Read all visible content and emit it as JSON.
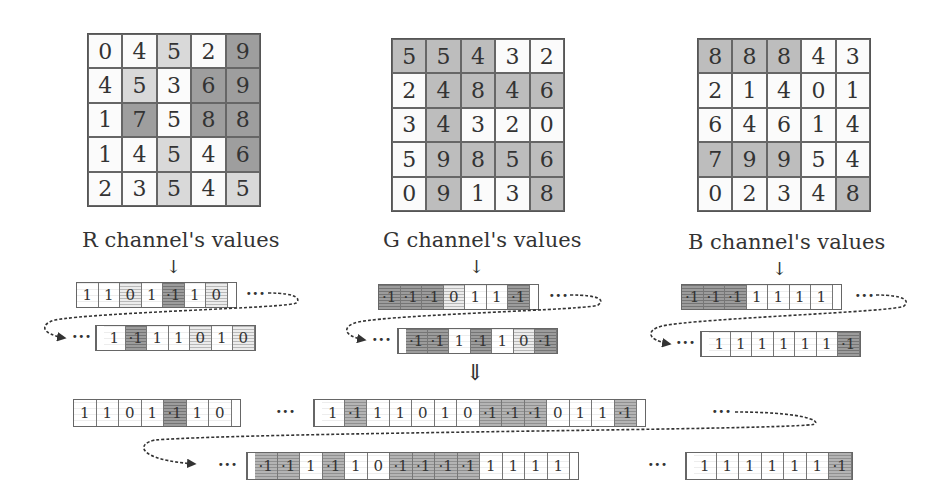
{
  "channels": [
    {
      "name": "R",
      "label": "R channel's values",
      "grid": [
        [
          0,
          4,
          5,
          2,
          9
        ],
        [
          4,
          5,
          3,
          6,
          9
        ],
        [
          1,
          7,
          5,
          8,
          8
        ],
        [
          1,
          4,
          5,
          4,
          6
        ],
        [
          2,
          3,
          5,
          4,
          5
        ]
      ],
      "shade": [
        [
          "w",
          "w",
          "l",
          "w",
          "D"
        ],
        [
          "w",
          "l",
          "w",
          "D",
          "D"
        ],
        [
          "w",
          "D",
          "w",
          "D",
          "D"
        ],
        [
          "w",
          "w",
          "l",
          "w",
          "D"
        ],
        [
          "w",
          "w",
          "l",
          "w",
          "l"
        ]
      ],
      "strip_top": [
        "1",
        "1",
        "0",
        "1",
        "-1",
        "1",
        "0"
      ],
      "strip_bottom": [
        "1",
        "-1",
        "1",
        "1",
        "0",
        "1",
        "0"
      ]
    },
    {
      "name": "G",
      "label": "G channel's values",
      "grid": [
        [
          5,
          5,
          4,
          3,
          2
        ],
        [
          2,
          4,
          8,
          4,
          6
        ],
        [
          3,
          4,
          3,
          2,
          0
        ],
        [
          5,
          9,
          8,
          5,
          6
        ],
        [
          0,
          9,
          1,
          3,
          8
        ]
      ],
      "shade": [
        [
          "m",
          "m",
          "m",
          "w",
          "w"
        ],
        [
          "w",
          "m",
          "m",
          "m",
          "m"
        ],
        [
          "w",
          "m",
          "w",
          "w",
          "w"
        ],
        [
          "w",
          "m",
          "m",
          "m",
          "m"
        ],
        [
          "w",
          "m",
          "w",
          "w",
          "m"
        ]
      ],
      "strip_top": [
        "-1",
        "-1",
        "-1",
        "0",
        "1",
        "1",
        "-1"
      ],
      "strip_bottom": [
        "-1",
        "-1",
        "1",
        "-1",
        "1",
        "0",
        "-1"
      ]
    },
    {
      "name": "B",
      "label": "B channel's values",
      "grid": [
        [
          8,
          8,
          8,
          4,
          3
        ],
        [
          2,
          1,
          4,
          0,
          1
        ],
        [
          6,
          4,
          6,
          1,
          4
        ],
        [
          7,
          9,
          9,
          5,
          4
        ],
        [
          0,
          2,
          3,
          4,
          8
        ]
      ],
      "shade": [
        [
          "m",
          "m",
          "m",
          "w",
          "w"
        ],
        [
          "w",
          "w",
          "w",
          "w",
          "w"
        ],
        [
          "w",
          "w",
          "w",
          "w",
          "w"
        ],
        [
          "m",
          "m",
          "m",
          "w",
          "w"
        ],
        [
          "w",
          "w",
          "w",
          "w",
          "m"
        ]
      ],
      "strip_top": [
        "-1",
        "-1",
        "-1",
        "1",
        "1",
        "1",
        "1"
      ],
      "strip_bottom": [
        "1",
        "1",
        "1",
        "1",
        "1",
        "1",
        "-1"
      ]
    }
  ],
  "symbols": {
    "down_arrow": "↓",
    "double_down_arrow": "⇓",
    "ellipsis": "···"
  },
  "combined": {
    "row1_seg1": [
      "1",
      "1",
      "0",
      "1",
      "-1",
      "1",
      "0"
    ],
    "row1_seg2": [
      "1",
      "-1",
      "1",
      "1",
      "0",
      "1",
      "0",
      "-1",
      "-1",
      "-1",
      "0",
      "1",
      "1",
      "-1"
    ],
    "row2_seg1": [
      "-1",
      "-1",
      "1",
      "-1",
      "1",
      "0",
      "-1",
      "-1",
      "-1",
      "-1",
      "1",
      "1",
      "1",
      "1"
    ],
    "row2_seg2": [
      "1",
      "1",
      "1",
      "1",
      "1",
      "1",
      "-1"
    ]
  }
}
